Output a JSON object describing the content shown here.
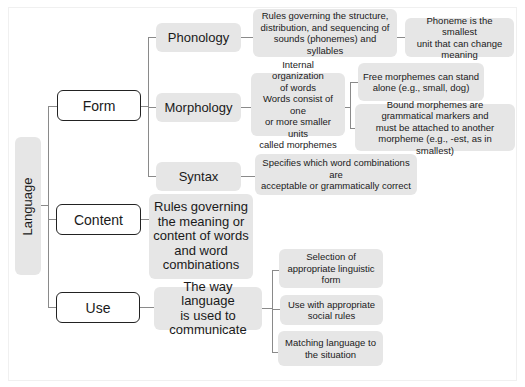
{
  "diagram": {
    "root": {
      "label": "Language"
    },
    "branches": [
      {
        "label": "Form",
        "children": [
          {
            "label": "Phonology",
            "description": "Rules governing the structure, distribution, and sequencing of sounds (phonemes) and syllables",
            "description_lines": [
              "Rules governing the structure,",
              "distribution, and sequencing of",
              "sounds (phonemes) and syllables"
            ],
            "note": "Phoneme is the smallest unit that can change meaning",
            "note_lines": [
              "Phoneme is the smallest",
              "unit that can change",
              "meaning"
            ]
          },
          {
            "label": "Morphology",
            "description": "Internal organization of words Words consist of one or more smaller units called morphemes",
            "description_lines": [
              "Internal organization",
              "of words",
              "Words consist of one",
              "or more smaller units",
              "called morphemes"
            ],
            "notes": [
              {
                "text": "Free morphemes can stand alone (e.g., small, dog)",
                "lines": [
                  "Free morphemes can stand",
                  "alone (e.g., small, dog)"
                ]
              },
              {
                "text": "Bound morphemes are grammatical markers and must be attached to another morpheme (e.g., -est, as in smallest)",
                "lines": [
                  "Bound morphemes are",
                  "grammatical markers and",
                  "must be attached to another",
                  "morpheme (e.g., -est, as in smallest)"
                ]
              }
            ]
          },
          {
            "label": "Syntax",
            "description": "Specifies which word combinations are acceptable or grammatically correct",
            "description_lines": [
              "Specifies which word combinations are",
              "acceptable or grammatically correct"
            ]
          }
        ]
      },
      {
        "label": "Content",
        "description": "Rules governing the meaning or content of words and word combinations",
        "description_lines": [
          "Rules governing",
          "the meaning or",
          "content of words",
          "and word",
          "combinations"
        ]
      },
      {
        "label": "Use",
        "description": "The way language is used to communicate",
        "description_lines": [
          "The way language",
          "is used to",
          "communicate"
        ],
        "notes": [
          {
            "text": "Selection of appropriate linguistic form",
            "lines": [
              "Selection of",
              "appropriate linguistic",
              "form"
            ]
          },
          {
            "text": "Use with appropriate social rules",
            "lines": [
              "Use with appropriate",
              "social rules"
            ]
          },
          {
            "text": "Matching language to the situation",
            "lines": [
              "Matching language to",
              "the situation"
            ]
          }
        ]
      }
    ]
  },
  "colors": {
    "box_fill": "#e6e6e6",
    "outline_border": "#222222",
    "connector": "#8a8a8a",
    "text": "#1a1a1a"
  }
}
